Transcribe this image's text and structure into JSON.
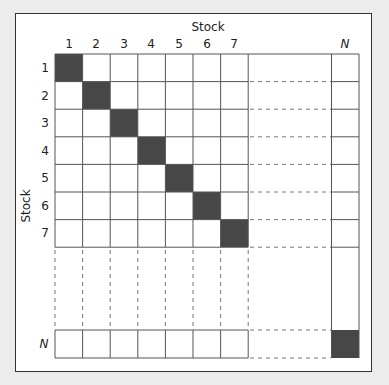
{
  "diagram": {
    "title_top": "Stock",
    "title_left": "Stock",
    "column_labels": [
      "1",
      "2",
      "3",
      "4",
      "5",
      "6",
      "7",
      "N"
    ],
    "row_labels": [
      "1",
      "2",
      "3",
      "4",
      "5",
      "6",
      "7",
      "N"
    ],
    "colors": {
      "diagonal_fill": "#474747",
      "grid_line": "#555555",
      "dashed_line": "#777777",
      "frame": "#333333",
      "background": "#ececec"
    }
  }
}
